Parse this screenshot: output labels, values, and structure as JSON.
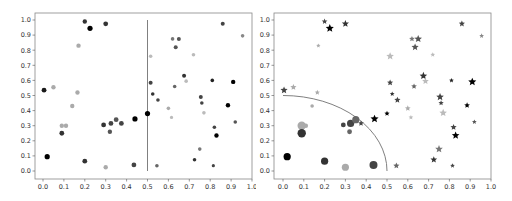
{
  "chart_data": [
    {
      "type": "scatter",
      "title": "",
      "xlabel": "",
      "ylabel": "",
      "xlim": [
        -0.05,
        1.0
      ],
      "ylim": [
        -0.05,
        1.05
      ],
      "grid": false,
      "legend": null,
      "x_ticks": [
        "0.0",
        "0.1",
        "0.2",
        "0.3",
        "0.4",
        "0.5",
        "0.6",
        "0.7",
        "0.8",
        "0.9",
        "1.0"
      ],
      "y_ticks": [
        "0.0",
        "0.1",
        "0.2",
        "0.3",
        "0.4",
        "0.5",
        "0.6",
        "0.7",
        "0.8",
        "0.9",
        "1.0"
      ],
      "annotations": [
        {
          "kind": "vertical-line",
          "x": 0.5,
          "y_from": 0.0,
          "y_to": 1.0,
          "color": "#808080"
        }
      ],
      "points": [
        {
          "x": 0.2,
          "y": 0.99,
          "c": "#333333",
          "s": 2.2
        },
        {
          "x": 0.225,
          "y": 0.945,
          "c": "#000000",
          "s": 2.6
        },
        {
          "x": 0.3,
          "y": 0.975,
          "c": "#333333",
          "s": 2.4
        },
        {
          "x": 0.17,
          "y": 0.83,
          "c": "#aaaaaa",
          "s": 2.2
        },
        {
          "x": 0.005,
          "y": 0.535,
          "c": "#1a1a1a",
          "s": 2.4
        },
        {
          "x": 0.05,
          "y": 0.555,
          "c": "#aaaaaa",
          "s": 2.2
        },
        {
          "x": 0.165,
          "y": 0.52,
          "c": "#aaaaaa",
          "s": 2.2
        },
        {
          "x": 0.14,
          "y": 0.43,
          "c": "#aaaaaa",
          "s": 2.2
        },
        {
          "x": 0.09,
          "y": 0.3,
          "c": "#aaaaaa",
          "s": 2.2
        },
        {
          "x": 0.11,
          "y": 0.3,
          "c": "#aaaaaa",
          "s": 2.2
        },
        {
          "x": 0.09,
          "y": 0.25,
          "c": "#333333",
          "s": 2.4
        },
        {
          "x": 0.29,
          "y": 0.305,
          "c": "#333333",
          "s": 2.4
        },
        {
          "x": 0.325,
          "y": 0.315,
          "c": "#444444",
          "s": 2.4
        },
        {
          "x": 0.35,
          "y": 0.34,
          "c": "#555555",
          "s": 2.4
        },
        {
          "x": 0.375,
          "y": 0.315,
          "c": "#444444",
          "s": 2.4
        },
        {
          "x": 0.32,
          "y": 0.26,
          "c": "#555555",
          "s": 2.2
        },
        {
          "x": 0.44,
          "y": 0.345,
          "c": "#000000",
          "s": 2.6
        },
        {
          "x": 0.5,
          "y": 0.38,
          "c": "#000000",
          "s": 2.6
        },
        {
          "x": 0.02,
          "y": 0.095,
          "c": "#000000",
          "s": 2.6
        },
        {
          "x": 0.2,
          "y": 0.065,
          "c": "#333333",
          "s": 2.4
        },
        {
          "x": 0.3,
          "y": 0.025,
          "c": "#aaaaaa",
          "s": 2.2
        },
        {
          "x": 0.435,
          "y": 0.04,
          "c": "#444444",
          "s": 2.4
        },
        {
          "x": 0.515,
          "y": 0.76,
          "c": "#bbbbbb",
          "s": 1.8
        },
        {
          "x": 0.62,
          "y": 0.875,
          "c": "#777777",
          "s": 1.8
        },
        {
          "x": 0.65,
          "y": 0.875,
          "c": "#555555",
          "s": 2.0
        },
        {
          "x": 0.635,
          "y": 0.82,
          "c": "#555555",
          "s": 2.0
        },
        {
          "x": 0.72,
          "y": 0.77,
          "c": "#bbbbbb",
          "s": 1.8
        },
        {
          "x": 0.86,
          "y": 0.975,
          "c": "#444444",
          "s": 2.0
        },
        {
          "x": 0.955,
          "y": 0.895,
          "c": "#888888",
          "s": 1.8
        },
        {
          "x": 0.515,
          "y": 0.585,
          "c": "#444444",
          "s": 2.0
        },
        {
          "x": 0.525,
          "y": 0.51,
          "c": "#333333",
          "s": 1.8
        },
        {
          "x": 0.55,
          "y": 0.47,
          "c": "#444444",
          "s": 1.8
        },
        {
          "x": 0.675,
          "y": 0.63,
          "c": "#333333",
          "s": 2.0
        },
        {
          "x": 0.685,
          "y": 0.595,
          "c": "#bbbbbb",
          "s": 1.8
        },
        {
          "x": 0.63,
          "y": 0.56,
          "c": "#666666",
          "s": 1.8
        },
        {
          "x": 0.81,
          "y": 0.6,
          "c": "#222222",
          "s": 1.8
        },
        {
          "x": 0.91,
          "y": 0.59,
          "c": "#000000",
          "s": 2.2
        },
        {
          "x": 0.755,
          "y": 0.49,
          "c": "#444444",
          "s": 2.0
        },
        {
          "x": 0.76,
          "y": 0.45,
          "c": "#444444",
          "s": 1.8
        },
        {
          "x": 0.6,
          "y": 0.415,
          "c": "#aaaaaa",
          "s": 1.8
        },
        {
          "x": 0.615,
          "y": 0.355,
          "c": "#bbbbbb",
          "s": 1.6
        },
        {
          "x": 0.77,
          "y": 0.385,
          "c": "#bbbbbb",
          "s": 1.8
        },
        {
          "x": 0.885,
          "y": 0.435,
          "c": "#000000",
          "s": 2.2
        },
        {
          "x": 0.82,
          "y": 0.29,
          "c": "#444444",
          "s": 1.8
        },
        {
          "x": 0.83,
          "y": 0.235,
          "c": "#000000",
          "s": 2.2
        },
        {
          "x": 0.92,
          "y": 0.325,
          "c": "#555555",
          "s": 1.8
        },
        {
          "x": 0.75,
          "y": 0.145,
          "c": "#777777",
          "s": 1.8
        },
        {
          "x": 0.725,
          "y": 0.075,
          "c": "#333333",
          "s": 1.8
        },
        {
          "x": 0.545,
          "y": 0.035,
          "c": "#666666",
          "s": 1.8
        },
        {
          "x": 0.815,
          "y": 0.035,
          "c": "#444444",
          "s": 1.6
        }
      ]
    },
    {
      "type": "scatter",
      "title": "",
      "xlabel": "",
      "ylabel": "",
      "xlim": [
        -0.05,
        1.0
      ],
      "ylim": [
        -0.05,
        1.05
      ],
      "grid": false,
      "legend": null,
      "x_ticks": [
        "0.0",
        "0.1",
        "0.2",
        "0.3",
        "0.4",
        "0.5",
        "0.6",
        "0.7",
        "0.8",
        "0.9",
        "1.0"
      ],
      "y_ticks": [
        "0.0",
        "0.1",
        "0.2",
        "0.3",
        "0.4",
        "0.5",
        "0.6",
        "0.7",
        "0.8",
        "0.9",
        "1.0"
      ],
      "annotations": [
        {
          "kind": "quarter-circle-arc",
          "center": [
            0,
            0
          ],
          "radius": 0.5,
          "color": "#808080"
        }
      ],
      "marker_rule": "circle if inside radius 0.5, star otherwise",
      "points": [
        {
          "x": 0.2,
          "y": 0.99,
          "c": "#444444",
          "s": 2.4,
          "m": "star"
        },
        {
          "x": 0.225,
          "y": 0.945,
          "c": "#000000",
          "s": 3.4,
          "m": "star"
        },
        {
          "x": 0.3,
          "y": 0.975,
          "c": "#333333",
          "s": 3.0,
          "m": "star"
        },
        {
          "x": 0.17,
          "y": 0.83,
          "c": "#aaaaaa",
          "s": 1.8,
          "m": "star"
        },
        {
          "x": 0.005,
          "y": 0.535,
          "c": "#444444",
          "s": 3.0,
          "m": "star"
        },
        {
          "x": 0.05,
          "y": 0.555,
          "c": "#aaaaaa",
          "s": 2.6,
          "m": "star"
        },
        {
          "x": 0.165,
          "y": 0.52,
          "c": "#aaaaaa",
          "s": 2.2,
          "m": "star"
        },
        {
          "x": 0.14,
          "y": 0.43,
          "c": "#aaaaaa",
          "s": 1.8,
          "m": "circle"
        },
        {
          "x": 0.09,
          "y": 0.3,
          "c": "#aaaaaa",
          "s": 4.2,
          "m": "circle"
        },
        {
          "x": 0.11,
          "y": 0.3,
          "c": "#aaaaaa",
          "s": 2.2,
          "m": "circle"
        },
        {
          "x": 0.09,
          "y": 0.25,
          "c": "#333333",
          "s": 4.2,
          "m": "circle"
        },
        {
          "x": 0.29,
          "y": 0.305,
          "c": "#444444",
          "s": 2.4,
          "m": "circle"
        },
        {
          "x": 0.325,
          "y": 0.315,
          "c": "#444444",
          "s": 3.6,
          "m": "circle"
        },
        {
          "x": 0.35,
          "y": 0.34,
          "c": "#666666",
          "s": 3.6,
          "m": "circle"
        },
        {
          "x": 0.375,
          "y": 0.315,
          "c": "#444444",
          "s": 2.4,
          "m": "star"
        },
        {
          "x": 0.32,
          "y": 0.26,
          "c": "#666666",
          "s": 2.4,
          "m": "circle"
        },
        {
          "x": 0.44,
          "y": 0.345,
          "c": "#000000",
          "s": 3.4,
          "m": "star"
        },
        {
          "x": 0.5,
          "y": 0.38,
          "c": "#000000",
          "s": 2.2,
          "m": "star"
        },
        {
          "x": 0.02,
          "y": 0.095,
          "c": "#000000",
          "s": 3.6,
          "m": "circle"
        },
        {
          "x": 0.2,
          "y": 0.065,
          "c": "#333333",
          "s": 3.6,
          "m": "circle"
        },
        {
          "x": 0.3,
          "y": 0.025,
          "c": "#aaaaaa",
          "s": 3.6,
          "m": "circle"
        },
        {
          "x": 0.435,
          "y": 0.04,
          "c": "#444444",
          "s": 4.0,
          "m": "circle"
        },
        {
          "x": 0.515,
          "y": 0.76,
          "c": "#bbbbbb",
          "s": 3.2,
          "m": "star"
        },
        {
          "x": 0.62,
          "y": 0.875,
          "c": "#777777",
          "s": 2.4,
          "m": "star"
        },
        {
          "x": 0.65,
          "y": 0.875,
          "c": "#555555",
          "s": 3.2,
          "m": "star"
        },
        {
          "x": 0.635,
          "y": 0.82,
          "c": "#555555",
          "s": 3.0,
          "m": "star"
        },
        {
          "x": 0.72,
          "y": 0.77,
          "c": "#bbbbbb",
          "s": 2.0,
          "m": "star"
        },
        {
          "x": 0.86,
          "y": 0.975,
          "c": "#444444",
          "s": 2.6,
          "m": "star"
        },
        {
          "x": 0.955,
          "y": 0.895,
          "c": "#888888",
          "s": 2.0,
          "m": "star"
        },
        {
          "x": 0.515,
          "y": 0.585,
          "c": "#444444",
          "s": 2.6,
          "m": "star"
        },
        {
          "x": 0.525,
          "y": 0.51,
          "c": "#333333",
          "s": 2.0,
          "m": "star"
        },
        {
          "x": 0.55,
          "y": 0.47,
          "c": "#444444",
          "s": 2.6,
          "m": "star"
        },
        {
          "x": 0.675,
          "y": 0.63,
          "c": "#333333",
          "s": 3.2,
          "m": "star"
        },
        {
          "x": 0.685,
          "y": 0.595,
          "c": "#bbbbbb",
          "s": 2.8,
          "m": "star"
        },
        {
          "x": 0.63,
          "y": 0.56,
          "c": "#666666",
          "s": 2.4,
          "m": "star"
        },
        {
          "x": 0.81,
          "y": 0.6,
          "c": "#222222",
          "s": 2.0,
          "m": "star"
        },
        {
          "x": 0.91,
          "y": 0.59,
          "c": "#000000",
          "s": 3.4,
          "m": "star"
        },
        {
          "x": 0.755,
          "y": 0.49,
          "c": "#444444",
          "s": 3.2,
          "m": "star"
        },
        {
          "x": 0.76,
          "y": 0.45,
          "c": "#444444",
          "s": 2.2,
          "m": "star"
        },
        {
          "x": 0.6,
          "y": 0.415,
          "c": "#aaaaaa",
          "s": 2.4,
          "m": "star"
        },
        {
          "x": 0.615,
          "y": 0.355,
          "c": "#bbbbbb",
          "s": 2.0,
          "m": "star"
        },
        {
          "x": 0.77,
          "y": 0.385,
          "c": "#bbbbbb",
          "s": 3.2,
          "m": "star"
        },
        {
          "x": 0.885,
          "y": 0.435,
          "c": "#000000",
          "s": 2.4,
          "m": "star"
        },
        {
          "x": 0.82,
          "y": 0.29,
          "c": "#444444",
          "s": 2.6,
          "m": "star"
        },
        {
          "x": 0.83,
          "y": 0.235,
          "c": "#000000",
          "s": 3.2,
          "m": "star"
        },
        {
          "x": 0.92,
          "y": 0.325,
          "c": "#555555",
          "s": 2.0,
          "m": "star"
        },
        {
          "x": 0.75,
          "y": 0.145,
          "c": "#777777",
          "s": 3.2,
          "m": "star"
        },
        {
          "x": 0.725,
          "y": 0.075,
          "c": "#333333",
          "s": 2.8,
          "m": "star"
        },
        {
          "x": 0.545,
          "y": 0.035,
          "c": "#666666",
          "s": 2.6,
          "m": "star"
        },
        {
          "x": 0.815,
          "y": 0.035,
          "c": "#444444",
          "s": 2.0,
          "m": "star"
        }
      ]
    }
  ],
  "colors": {
    "frame": "#888888",
    "tick_label": "#333333",
    "reference_line": "#808080"
  }
}
